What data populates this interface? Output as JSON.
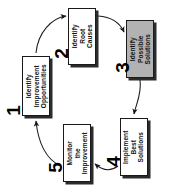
{
  "diagram": {
    "orientation": "rotated-90-ccw",
    "background_color": "#ffffff",
    "shaded_color": "#b2b2b2",
    "line_color": "#1a1a1a",
    "steps": [
      {
        "number": "1",
        "label_line1": "Identify",
        "label_line2": "Improvement",
        "label_line3": "Opportunities",
        "shaded": false
      },
      {
        "number": "2",
        "label_line1": "Identify",
        "label_line2": "Root",
        "label_line3": "Causes",
        "shaded": false
      },
      {
        "number": "3",
        "label_line1": "Identify",
        "label_line2": "Possible",
        "label_line3": "Solutions",
        "shaded": true
      },
      {
        "number": "4",
        "label_line1": "Implement",
        "label_line2": "Best",
        "label_line3": "Solutions",
        "shaded": false
      },
      {
        "number": "5",
        "label_line1": "Monitor",
        "label_line2": "the",
        "label_line3": "Improvement",
        "shaded": false
      }
    ],
    "connectors": [
      {
        "from": "1",
        "to": "2",
        "style": "curved-arrow"
      },
      {
        "from": "2",
        "to": "3",
        "style": "curved-arrow"
      },
      {
        "from": "3",
        "to": "4",
        "style": "curved-arrow"
      },
      {
        "from": "4",
        "to": "5",
        "style": "curved-arrow"
      },
      {
        "from": "5",
        "to": "1",
        "style": "curved-arrow"
      }
    ]
  }
}
